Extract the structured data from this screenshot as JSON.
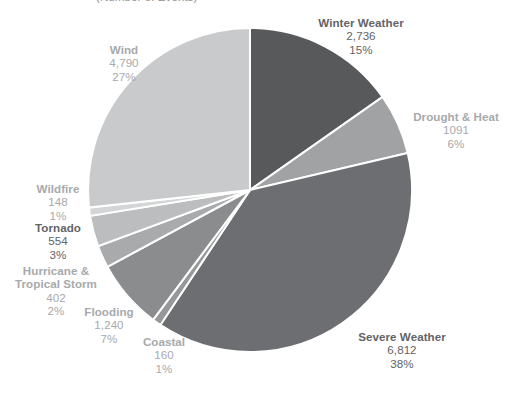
{
  "subtitle": "(Number of Events)",
  "chart_data": {
    "type": "pie",
    "title": "",
    "subtitle": "(Number of Events)",
    "unit": "Number of Events",
    "total": 18932,
    "start_angle_deg": 0,
    "direction": "clockwise",
    "legend": "none (direct labels)",
    "grid": false,
    "categories": [
      "Winter Weather",
      "Drought & Heat",
      "Severe Weather",
      "Coastal",
      "Flooding",
      "Hurricane & Tropical Storm",
      "Tornado",
      "Wildfire",
      "Wind"
    ],
    "values": [
      2736,
      1091,
      6812,
      160,
      1240,
      402,
      554,
      148,
      4790
    ],
    "percents": [
      15,
      6,
      38,
      1,
      7,
      2,
      3,
      1,
      27
    ],
    "colors": [
      "#58595b",
      "#a0a2a4",
      "#6d6e71",
      "#96989a",
      "#8a8c8e",
      "#a8aaac",
      "#bcbdbf",
      "#d4d5d6",
      "#c9cacb"
    ],
    "slices": [
      {
        "name": "Winter Weather",
        "value": "2,736",
        "percent": "15%",
        "color": "#58595b",
        "sweep_deg": 52.0,
        "label_style": "dark",
        "label_align": "center"
      },
      {
        "name": "Drought & Heat",
        "value": "1091",
        "percent": "6%",
        "color": "#a0a2a4",
        "sweep_deg": 20.7,
        "label_style": "light",
        "label_align": "center"
      },
      {
        "name": "Severe Weather",
        "value": "6,812",
        "percent": "38%",
        "color": "#6d6e71",
        "sweep_deg": 129.5,
        "label_style": "dark",
        "label_align": "center"
      },
      {
        "name": "Coastal",
        "value": "160",
        "percent": "1%",
        "color": "#96989a",
        "sweep_deg": 3.0,
        "label_style": "light",
        "label_align": "center"
      },
      {
        "name": "Flooding",
        "value": "1,240",
        "percent": "7%",
        "color": "#8a8c8e",
        "sweep_deg": 23.6,
        "label_style": "light",
        "label_align": "center"
      },
      {
        "name": "Hurricane & Tropical Storm",
        "name_line1": "Hurricane &",
        "name_line2": "Tropical Storm",
        "value": "402",
        "percent": "2%",
        "color": "#a8aaac",
        "sweep_deg": 7.6,
        "label_style": "light",
        "label_align": "center"
      },
      {
        "name": "Tornado",
        "value": "554",
        "percent": "3%",
        "color": "#bcbdbf",
        "sweep_deg": 10.5,
        "label_style": "dark",
        "label_align": "center"
      },
      {
        "name": "Wildfire",
        "value": "148",
        "percent": "1%",
        "color": "#d4d5d6",
        "sweep_deg": 2.8,
        "label_style": "light",
        "label_align": "center"
      },
      {
        "name": "Wind",
        "value": "4,790",
        "percent": "27%",
        "color": "#c9cacb",
        "sweep_deg": 91.1,
        "label_style": "light",
        "label_align": "center"
      }
    ]
  }
}
